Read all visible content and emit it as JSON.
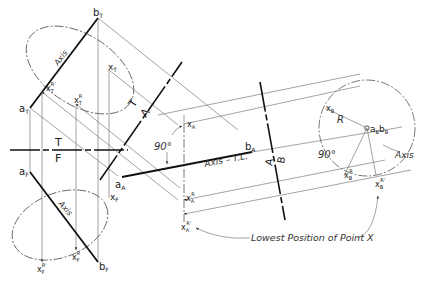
{
  "figure": {
    "type": "descriptive-geometry",
    "views": {
      "top": {
        "a": {
          "label": "a",
          "sub": "T"
        },
        "b": {
          "label": "b",
          "sub": "T"
        },
        "x": {
          "label": "x",
          "sub": "T"
        },
        "xR": {
          "label": "x",
          "sub": "T",
          "sup": "R"
        },
        "xRp": {
          "label": "x",
          "sub": "T",
          "sup": "R'"
        },
        "axis_label": "Axis"
      },
      "front": {
        "a": {
          "label": "a",
          "sub": "F"
        },
        "b": {
          "label": "b",
          "sub": "F"
        },
        "x": {
          "label": "x",
          "sub": "F"
        },
        "xR": {
          "label": "x",
          "sub": "F",
          "sup": "R"
        },
        "xRp": {
          "label": "x",
          "sub": "F",
          "sup": "R'"
        },
        "axis_label": "Axis"
      },
      "auxA": {
        "a": {
          "label": "a",
          "sub": "A"
        },
        "b": {
          "label": "b",
          "sub": "A"
        },
        "x": {
          "label": "x",
          "sub": "A"
        },
        "xR": {
          "label": "x",
          "sub": "A",
          "sup": "R"
        },
        "xRp": {
          "label": "x",
          "sub": "A",
          "sup": "R'"
        },
        "axis_label": "Axis – T.L.",
        "angle": "90°"
      },
      "auxB": {
        "ab": {
          "label": "a",
          "sub": "B",
          "label2": "b",
          "sub2": "B"
        },
        "x": {
          "label": "x",
          "sub": "B"
        },
        "xR": {
          "label": "x",
          "sub": "B",
          "sup": "R"
        },
        "xRp": {
          "label": "x",
          "sub": "B",
          "sup": "R'"
        },
        "radius": "R",
        "angle": "90°",
        "axis_label": "Axis"
      }
    },
    "fold_lines": {
      "tf": {
        "upper": "T",
        "lower": "F"
      },
      "ta": {
        "left": "T",
        "right": "A"
      },
      "ab": {
        "left": "A",
        "right": "B"
      }
    },
    "annotation": "Lowest Position of Point X"
  }
}
